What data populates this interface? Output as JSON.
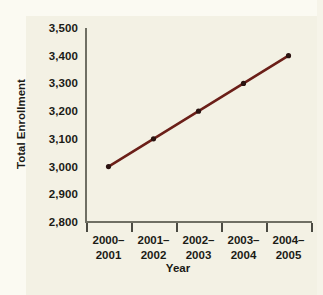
{
  "chart_data": {
    "type": "line",
    "title": "",
    "xlabel": "Year",
    "ylabel": "Total Enrollment",
    "categories": [
      "2000–2001",
      "2001–2002",
      "2002–2003",
      "2003–2004",
      "2004–2005"
    ],
    "category_lines": [
      [
        "2000–",
        "2001"
      ],
      [
        "2001–",
        "2002"
      ],
      [
        "2002–",
        "2003"
      ],
      [
        "2003–",
        "2004"
      ],
      [
        "2004–",
        "2005"
      ]
    ],
    "values": [
      3000,
      3100,
      3200,
      3300,
      3400
    ],
    "ylim": [
      2800,
      3500
    ],
    "ytick_values": [
      2800,
      2900,
      3000,
      3100,
      3200,
      3300,
      3400,
      3500
    ],
    "ytick_labels": [
      "2,800",
      "2,900",
      "3,000",
      "3,100",
      "3,200",
      "3,300",
      "3,400",
      "3,500"
    ],
    "grid": false,
    "legend": "none",
    "series_color": "#6b1f18",
    "marker": "circle",
    "background_color": "#f3f1e4",
    "axis_color": "#6f6f63",
    "text_color": "#1b1b16"
  }
}
